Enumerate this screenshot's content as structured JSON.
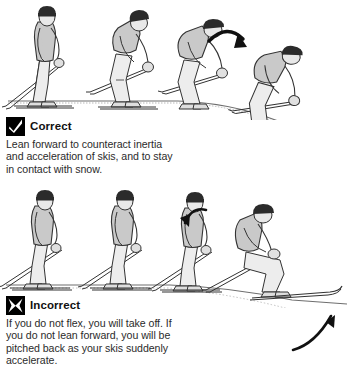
{
  "figure": {
    "panels": [
      {
        "id": "correct",
        "mark_icon": "checkmark-icon",
        "title": "Correct",
        "body_lines": [
          "Lean forward to counteract inertia",
          "and acceleration of skis, and to stay",
          "in contact with snow."
        ],
        "sequence_count": 4,
        "arrow_label": "forward-rotation-arrow"
      },
      {
        "id": "incorrect",
        "mark_icon": "x-mark-icon",
        "title": "Incorrect",
        "body_lines": [
          "If you do not flex, you will take off. If",
          "you do not lean forward, you will be",
          "pitched back as your skis suddenly",
          "accelerate."
        ],
        "sequence_count": 4,
        "arrow_label": "backward-rotation-arrow",
        "arrow_label_2": "ski-acceleration-arrow"
      }
    ]
  },
  "colors": {
    "ink": "#1a1a1a",
    "outline": "#333333",
    "jacket": "#c9c9c9",
    "pants": "#e8e8e8",
    "hat": "#2b2b2b",
    "snow_line": "#6e6e6e",
    "mark_fill": "#000000",
    "background": "#ffffff"
  }
}
